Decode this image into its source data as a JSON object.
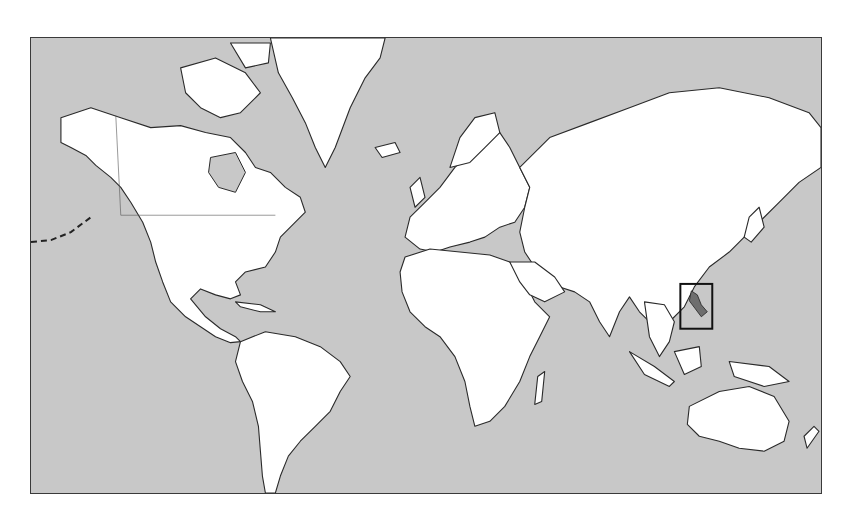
{
  "map": {
    "type": "world-political-outline",
    "projection": "mercator",
    "colors": {
      "ocean": "#c8c8c8",
      "land": "#ffffff",
      "outline": "#2a2a2a",
      "highlight_fill": "#6e6e6e",
      "highlight_box": "#111111"
    },
    "highlighted_region": {
      "name": "Philippines",
      "box": {
        "x": 681,
        "y": 284,
        "width": 32,
        "height": 45
      }
    }
  }
}
